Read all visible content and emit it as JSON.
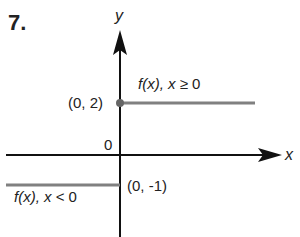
{
  "problem": {
    "number": "7."
  },
  "axes": {
    "x_label": "x",
    "y_label": "y",
    "origin_label": "0"
  },
  "points": {
    "upper": "(0, 2)",
    "lower": "(0, -1)"
  },
  "pieces": {
    "upper": {
      "f": "f(x),",
      "cond_var": "x",
      "cond_rel": "≥",
      "cond_val": "0"
    },
    "lower": {
      "f": "f(x),",
      "cond_var": "x",
      "cond_rel": "<",
      "cond_val": "0"
    }
  },
  "colors": {
    "axis": "#111111",
    "line": "#808080"
  }
}
